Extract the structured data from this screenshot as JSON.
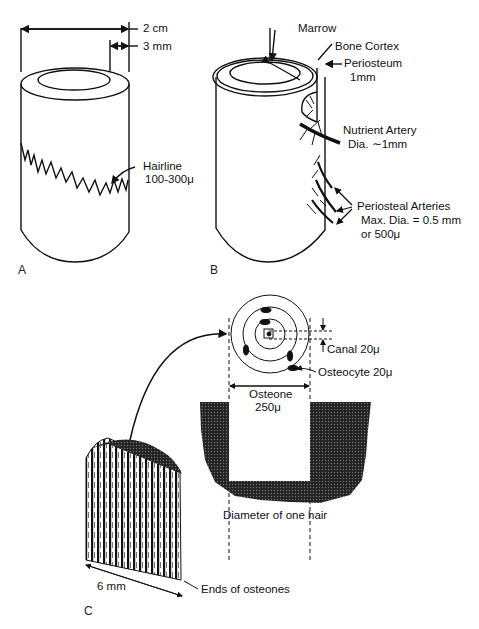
{
  "panels": {
    "A": {
      "letter": "A",
      "dim_outer": "2 cm",
      "dim_wall": "3 mm",
      "hairline_label": "Hairline",
      "hairline_size": "100-300μ"
    },
    "B": {
      "letter": "B",
      "marrow": "Marrow",
      "bone_cortex": "Bone Cortex",
      "periosteum": "Periosteum",
      "periosteum_size": "1mm",
      "nutrient_artery": "Nutrient Artery",
      "nutrient_artery_dia": "Dia. ∼1mm",
      "periosteal_arteries": "Periosteal Arteries",
      "periosteal_max": "Max. Dia. = 0.5 mm",
      "periosteal_alt": "or  500μ"
    },
    "C": {
      "letter": "C",
      "canal": "Canal 20μ",
      "osteocyte": "Osteocyte 20μ",
      "osteone_label": "Osteone",
      "osteone_size": "250μ",
      "hair_caption": "Diameter of one hair",
      "block_width": "6 mm",
      "ends_label": "Ends of osteones"
    }
  }
}
